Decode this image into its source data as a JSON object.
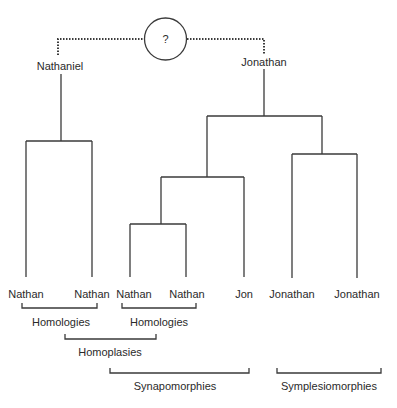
{
  "diagram": {
    "type": "cladogram",
    "ancestor_symbol": "?",
    "roots": [
      {
        "label": "Nathaniel"
      },
      {
        "label": "Jonathan"
      }
    ],
    "tips": [
      {
        "label": "Nathan"
      },
      {
        "label": "Nathan"
      },
      {
        "label": "Nathan"
      },
      {
        "label": "Nathan"
      },
      {
        "label": "Jon"
      },
      {
        "label": "Jonathan"
      },
      {
        "label": "Jonathan"
      }
    ],
    "groupings": [
      {
        "label": "Homologies",
        "spans": "tips 1-2"
      },
      {
        "label": "Homologies",
        "spans": "tips 3-4"
      },
      {
        "label": "Homoplasies",
        "spans": "tip 2 to tip 3"
      },
      {
        "label": "Synapomorphies",
        "spans": "tips 3-5"
      },
      {
        "label": "Symplesiomorphies",
        "spans": "tips 6-7"
      }
    ],
    "colors": {
      "line": "#3a3a3a",
      "text": "#2a2a2a",
      "background": "#ffffff"
    }
  }
}
